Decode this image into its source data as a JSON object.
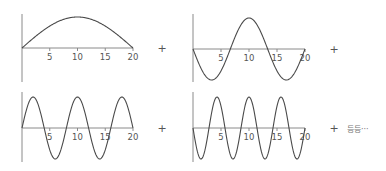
{
  "operator": "+",
  "etc_label": "등등···",
  "colors": {
    "axis": "#8a8a8a",
    "curve": "#4a4a4a",
    "text": "#555555"
  },
  "chart_data": [
    {
      "type": "line",
      "title": "",
      "function": "sin(pi*x/20)",
      "harmonic": 1,
      "sign": 1,
      "xlim": [
        0,
        20
      ],
      "ylim": [
        -1,
        1
      ],
      "xticks": [
        5,
        10,
        15,
        20
      ],
      "tick_labels": [
        "5",
        "10",
        "15",
        "20"
      ],
      "grid": false
    },
    {
      "type": "line",
      "title": "",
      "function": "-sin(3*pi*x/20)",
      "harmonic": 3,
      "sign": -1,
      "xlim": [
        0,
        20
      ],
      "ylim": [
        -1,
        1
      ],
      "xticks": [
        5,
        10,
        15,
        20
      ],
      "tick_labels": [
        "5",
        "10",
        "15",
        "20"
      ],
      "grid": false
    },
    {
      "type": "line",
      "title": "",
      "function": "sin(5*pi*x/20)",
      "harmonic": 5,
      "sign": 1,
      "xlim": [
        0,
        20
      ],
      "ylim": [
        -1,
        1
      ],
      "xticks": [
        5,
        10,
        15,
        20
      ],
      "tick_labels": [
        "5",
        "10",
        "15",
        "20"
      ],
      "grid": false
    },
    {
      "type": "line",
      "title": "",
      "function": "-sin(7*pi*x/20)",
      "harmonic": 7,
      "sign": -1,
      "xlim": [
        0,
        20
      ],
      "ylim": [
        -1,
        1
      ],
      "xticks": [
        5,
        10,
        15,
        20
      ],
      "tick_labels": [
        "5",
        "10",
        "15",
        "20"
      ],
      "grid": false
    }
  ],
  "panels": [
    {
      "x0": 22,
      "y0": 48,
      "width": 111,
      "amp": 31,
      "ytop": 14,
      "ybot": 82,
      "plus_x": 162,
      "plus_y": 52
    },
    {
      "x0": 193,
      "y0": 49,
      "width": 112,
      "amp": 31,
      "ytop": 14,
      "ybot": 82,
      "plus_x": 334,
      "plus_y": 53
    },
    {
      "x0": 22,
      "y0": 128,
      "width": 111,
      "amp": 31,
      "ytop": 92,
      "ybot": 162,
      "plus_x": 162,
      "plus_y": 132
    },
    {
      "x0": 193,
      "y0": 128,
      "width": 112,
      "amp": 31,
      "ytop": 92,
      "ybot": 162,
      "plus_x": 334,
      "plus_y": 132
    }
  ]
}
